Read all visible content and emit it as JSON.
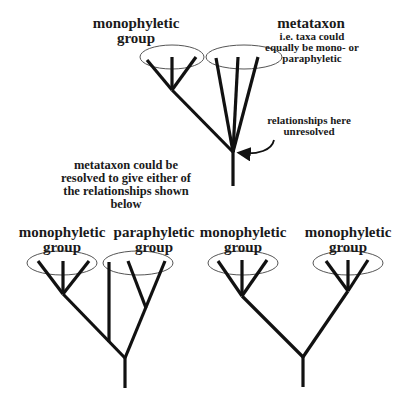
{
  "top": {
    "left_group_label": [
      "monophyletic",
      "group"
    ],
    "metataxon_title": "metataxon",
    "metataxon_note": [
      "i.e. taxa could",
      "equally be mono- or",
      "paraphyletic"
    ],
    "unresolved_note": [
      "relationships here",
      "unresolved"
    ],
    "resolution_note": [
      "metataxon could be",
      "resolved to give either of",
      "the relationships shown",
      "below"
    ]
  },
  "bottom_left": {
    "left_group_label": [
      "monophyletic",
      "group"
    ],
    "right_group_label": [
      "paraphyletic",
      "group"
    ]
  },
  "bottom_right": {
    "left_group_label": [
      "monophyletic",
      "group"
    ],
    "right_group_label": [
      "monophyletic",
      "group"
    ]
  },
  "colors": {
    "line": "#111111",
    "ellipse": "#555555",
    "text": "#1a1a1a",
    "background": "#ffffff"
  }
}
